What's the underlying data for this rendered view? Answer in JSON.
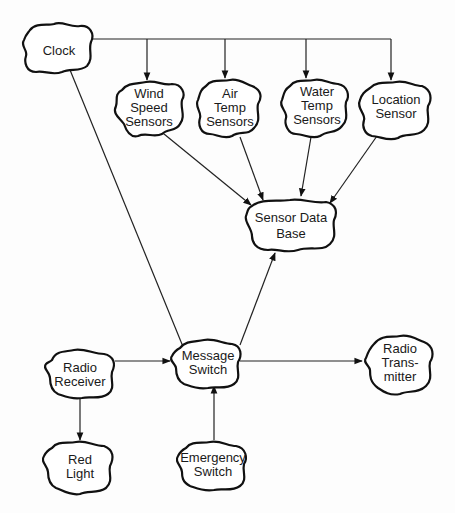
{
  "diagram": {
    "type": "data-flow",
    "nodes": [
      {
        "id": "clock",
        "lines": [
          "Clock"
        ]
      },
      {
        "id": "wind",
        "lines": [
          "Wind",
          "Speed",
          "Sensors"
        ]
      },
      {
        "id": "air",
        "lines": [
          "Air",
          "Temp",
          "Sensors"
        ]
      },
      {
        "id": "water",
        "lines": [
          "Water",
          "Temp",
          "Sensors"
        ]
      },
      {
        "id": "location",
        "lines": [
          "Location",
          "Sensor"
        ]
      },
      {
        "id": "sdb",
        "lines": [
          "Sensor Data",
          "Base"
        ]
      },
      {
        "id": "radio_rx",
        "lines": [
          "Radio",
          "Receiver"
        ]
      },
      {
        "id": "msg",
        "lines": [
          "Message",
          "Switch"
        ]
      },
      {
        "id": "radio_tx",
        "lines": [
          "Radio",
          "Trans-",
          "mitter"
        ]
      },
      {
        "id": "red",
        "lines": [
          "Red",
          "Light"
        ]
      },
      {
        "id": "emergency",
        "lines": [
          "Emergency",
          "Switch"
        ]
      }
    ],
    "edges": [
      {
        "from": "Clock",
        "to": "Wind Speed Sensors"
      },
      {
        "from": "Clock",
        "to": "Air Temp Sensors"
      },
      {
        "from": "Clock",
        "to": "Water Temp Sensors"
      },
      {
        "from": "Clock",
        "to": "Location Sensor"
      },
      {
        "from": "Clock",
        "to": "Message Switch"
      },
      {
        "from": "Wind Speed Sensors",
        "to": "Sensor Data Base"
      },
      {
        "from": "Air Temp Sensors",
        "to": "Sensor Data Base"
      },
      {
        "from": "Water Temp Sensors",
        "to": "Sensor Data Base"
      },
      {
        "from": "Location Sensor",
        "to": "Sensor Data Base"
      },
      {
        "from": "Message Switch",
        "to": "Sensor Data Base"
      },
      {
        "from": "Radio Receiver",
        "to": "Message Switch"
      },
      {
        "from": "Message Switch",
        "to": "Radio Transmitter"
      },
      {
        "from": "Radio Receiver",
        "to": "Red Light"
      },
      {
        "from": "Emergency Switch",
        "to": "Message Switch"
      }
    ]
  }
}
